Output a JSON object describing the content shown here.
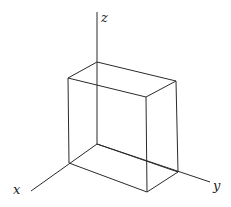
{
  "diagram": {
    "title": "",
    "axes": {
      "x": {
        "label": "x",
        "from": [
          97,
          144
        ],
        "to": [
          31,
          191
        ],
        "label_pos": [
          13,
          194
        ]
      },
      "y": {
        "label": "y",
        "from": [
          97,
          144
        ],
        "to": [
          210,
          182
        ],
        "label_pos": [
          213,
          190
        ]
      },
      "z": {
        "label": "z",
        "from": [
          97,
          144
        ],
        "to": [
          97,
          12
        ],
        "label_pos": [
          101,
          22
        ]
      }
    },
    "box": {
      "vertices": {
        "back_bottom": [
          97,
          144
        ],
        "left_bottom": [
          69,
          163
        ],
        "front_bottom": [
          147,
          192
        ],
        "right_bottom": [
          178,
          172
        ],
        "back_top": [
          97,
          62
        ],
        "left_top": [
          68,
          78
        ],
        "front_top": [
          146,
          97
        ],
        "right_top": [
          176,
          81
        ]
      },
      "edges": [
        [
          "left_bottom",
          "front_bottom"
        ],
        [
          "front_bottom",
          "right_bottom"
        ],
        [
          "back_bottom",
          "right_bottom"
        ],
        [
          "back_top",
          "left_top"
        ],
        [
          "left_top",
          "front_top"
        ],
        [
          "front_top",
          "right_top"
        ],
        [
          "right_top",
          "back_top"
        ],
        [
          "left_bottom",
          "left_top"
        ],
        [
          "front_bottom",
          "front_top"
        ],
        [
          "right_bottom",
          "right_top"
        ]
      ]
    },
    "stroke_color": "#2a2a2a"
  }
}
